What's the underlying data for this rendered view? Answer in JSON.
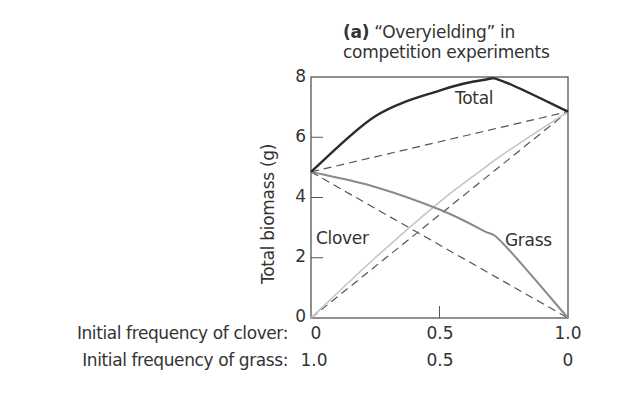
{
  "title": {
    "panel": "(a)",
    "line1": "“Overyielding” in",
    "line2": "competition experiments"
  },
  "chart_data": {
    "type": "line",
    "title": "(a) “Overyielding” in competition experiments",
    "ylabel": "Total biomass (g)",
    "xlabel_rows": [
      {
        "label": "Initial frequency of clover:",
        "ticks": [
          "0",
          "0.5",
          "1.0"
        ]
      },
      {
        "label": "Initial frequency of grass:",
        "ticks": [
          "1.0",
          "0.5",
          "0"
        ]
      }
    ],
    "x": [
      0,
      0.25,
      0.5,
      0.67,
      0.75,
      1.0
    ],
    "ylim": [
      0,
      8
    ],
    "yticks": [
      "0",
      "2",
      "4",
      "6",
      "8"
    ],
    "grid": false,
    "series": [
      {
        "name": "Total",
        "style": "solid-dark",
        "values": [
          4.85,
          6.7,
          7.55,
          7.9,
          7.85,
          6.85
        ]
      },
      {
        "name": "Grass",
        "style": "solid-gray",
        "values": [
          4.85,
          4.35,
          3.6,
          2.9,
          2.45,
          0
        ]
      },
      {
        "name": "Clover",
        "style": "solid-lightgray",
        "values": [
          0,
          2.0,
          3.85,
          4.95,
          5.45,
          6.85
        ]
      },
      {
        "name": "Expected total",
        "style": "dashed",
        "values": [
          4.85,
          5.35,
          5.85,
          6.18,
          6.35,
          6.85
        ]
      },
      {
        "name": "Expected grass",
        "style": "dashed",
        "values": [
          4.85,
          3.64,
          2.43,
          1.6,
          1.21,
          0
        ]
      },
      {
        "name": "Expected clover",
        "style": "dashed",
        "values": [
          0,
          1.71,
          3.43,
          4.59,
          5.14,
          6.85
        ]
      }
    ],
    "annotations": [
      "Total",
      "Clover",
      "Grass"
    ]
  },
  "axis": {
    "ylabel": "Total biomass (g)",
    "yticks": [
      "0",
      "2",
      "4",
      "6",
      "8"
    ]
  },
  "rows": {
    "clover_label": "Initial frequency of clover:",
    "grass_label": "Initial frequency of grass:",
    "clover_ticks": [
      "0",
      "0.5",
      "1.0"
    ],
    "grass_ticks": [
      "1.0",
      "0.5",
      "0"
    ]
  },
  "labels": {
    "total": "Total",
    "clover": "Clover",
    "grass": "Grass"
  },
  "colors": {
    "axis": "#555555",
    "total": "#2b2b2b",
    "grass": "#8a8a8a",
    "clover": "#c4c4c4",
    "dashed": "#555555"
  }
}
